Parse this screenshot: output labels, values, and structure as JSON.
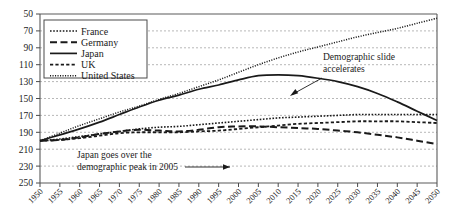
{
  "chart_data": {
    "type": "line",
    "title": "",
    "subtitle": "",
    "xlabel": "",
    "ylabel": "",
    "grid": true,
    "legend_position": "top-left",
    "xlim": [
      1950,
      2050
    ],
    "ylim": [
      50,
      250
    ],
    "ytick_step": 20,
    "xtick_step": 5,
    "x": [
      1950,
      1955,
      1960,
      1965,
      1970,
      1975,
      1980,
      1985,
      1990,
      1995,
      2000,
      2005,
      2010,
      2015,
      2020,
      2025,
      2030,
      2035,
      2040,
      2045,
      2050
    ],
    "categories": [
      "1950",
      "1955",
      "1960",
      "1965",
      "1970",
      "1975",
      "1980",
      "1985",
      "1990",
      "1995",
      "2000",
      "2005",
      "2010",
      "2015",
      "2020",
      "2025",
      "2030",
      "2035",
      "2040",
      "2045",
      "2050"
    ],
    "yticks": [
      50,
      70,
      90,
      110,
      130,
      150,
      170,
      190,
      210,
      230,
      250
    ],
    "series": [
      {
        "name": "France",
        "line_style": "dotted",
        "color": "#1a1a1a",
        "values": [
          100,
          102,
          105,
          108,
          111,
          114,
          116,
          117,
          119,
          121,
          123,
          125,
          127,
          128,
          129,
          130,
          131,
          131,
          131,
          131,
          131
        ]
      },
      {
        "name": "Germany",
        "line_style": "dashed",
        "color": "#1a1a1a",
        "values": [
          100,
          101,
          104,
          108,
          111,
          113,
          112,
          111,
          113,
          116,
          117,
          117,
          116,
          115,
          114,
          112,
          110,
          107,
          104,
          100,
          96
        ]
      },
      {
        "name": "Japan",
        "line_style": "solid",
        "color": "#1a1a1a",
        "values": [
          100,
          107,
          114,
          122,
          131,
          140,
          148,
          154,
          161,
          166,
          172,
          177,
          178,
          177,
          174,
          170,
          164,
          156,
          146,
          135,
          124
        ]
      },
      {
        "name": "UK",
        "line_style": "dash-dot",
        "color": "#1a1a1a",
        "values": [
          100,
          101,
          103,
          106,
          109,
          110,
          110,
          110,
          111,
          112,
          114,
          116,
          118,
          120,
          121,
          122,
          123,
          123,
          123,
          122,
          121
        ]
      },
      {
        "name": "United States",
        "line_style": "fine-dotted",
        "color": "#1a1a1a",
        "values": [
          100,
          109,
          118,
          126,
          134,
          141,
          149,
          156,
          164,
          172,
          181,
          190,
          198,
          205,
          211,
          217,
          223,
          228,
          233,
          239,
          245
        ]
      }
    ],
    "annotations": [
      {
        "id": "japan-peak",
        "line1": "Japan goes over the",
        "line2": "demographic peak in 2005",
        "has_arrow": true,
        "arrow_direction": "right"
      },
      {
        "id": "demographic-slide",
        "line1": "Demographic slide",
        "line2": "accelerates",
        "has_arrow": true,
        "arrow_direction": "down-left"
      }
    ]
  },
  "legend": {
    "items": [
      {
        "label": "France"
      },
      {
        "label": "Germany"
      },
      {
        "label": "Japan"
      },
      {
        "label": "UK"
      },
      {
        "label": "United States"
      }
    ]
  },
  "axes": {
    "y_labels": [
      "250",
      "230",
      "210",
      "190",
      "170",
      "150",
      "130",
      "110",
      "90",
      "70",
      "50"
    ],
    "x_labels": [
      "1950",
      "1955",
      "1960",
      "1965",
      "1970",
      "1975",
      "1980",
      "1985",
      "1990",
      "1995",
      "2000",
      "2005",
      "2010",
      "2015",
      "2020",
      "2025",
      "2030",
      "2035",
      "2040",
      "2045",
      "2050"
    ]
  },
  "annotations": {
    "japan_peak_line1": "Japan goes over the",
    "japan_peak_line2": "demographic peak in 2005",
    "slide_line1": "Demographic slide",
    "slide_line2": "accelerates"
  },
  "colors": {
    "ink": "#1a1a1a",
    "grid": "#9a9a9a",
    "background": "#ffffff"
  }
}
